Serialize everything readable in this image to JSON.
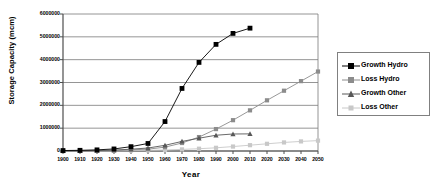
{
  "chart_data": {
    "type": "line",
    "title": "",
    "xlabel": "Year",
    "ylabel": "Storage Capacity (mcm)",
    "x": [
      1900,
      1910,
      1920,
      1930,
      1940,
      1950,
      1960,
      1970,
      1980,
      1990,
      2000,
      2010,
      2020,
      2030,
      2040,
      2050
    ],
    "xlim": [
      1900,
      2050
    ],
    "ylim": [
      0,
      6000000
    ],
    "ytick_labels": [
      "0",
      "1000000",
      "2000000",
      "3000000",
      "4000000",
      "5000000",
      "6000000"
    ],
    "ytick_values": [
      0,
      1000000,
      2000000,
      3000000,
      4000000,
      5000000,
      6000000
    ],
    "xtick_labels": [
      "1900",
      "1910",
      "1920",
      "1930",
      "1940",
      "1950",
      "1960",
      "1970",
      "1980",
      "1990",
      "2000",
      "2010",
      "2020",
      "2030",
      "2040",
      "2050"
    ],
    "grid": true,
    "legend_position": "right",
    "series": [
      {
        "name": "Growth Hydro",
        "marker": "square",
        "color": "#000000",
        "values": [
          20000,
          30000,
          50000,
          90000,
          190000,
          330000,
          1290000,
          2740000,
          3880000,
          4670000,
          5150000,
          5380000,
          null,
          null,
          null,
          null
        ]
      },
      {
        "name": "Loss Hydro",
        "marker": "square",
        "color": "#8c8c8c",
        "values": [
          0,
          5000,
          12000,
          25000,
          50000,
          80000,
          170000,
          350000,
          610000,
          960000,
          1350000,
          1780000,
          2220000,
          2640000,
          3060000,
          3480000
        ]
      },
      {
        "name": "Growth Other",
        "marker": "triangle",
        "color": "#585858",
        "values": [
          5000,
          10000,
          20000,
          40000,
          80000,
          130000,
          250000,
          420000,
          560000,
          690000,
          745000,
          750000,
          null,
          null,
          null,
          null
        ]
      },
      {
        "name": "Loss Other",
        "marker": "square",
        "color": "#c8c8c8",
        "values": [
          0,
          2000,
          5000,
          10000,
          18000,
          28000,
          45000,
          70000,
          100000,
          140000,
          195000,
          255000,
          315000,
          375000,
          420000,
          455000
        ]
      }
    ]
  },
  "legend": {
    "items": [
      {
        "label": "Growth Hydro"
      },
      {
        "label": "Loss Hydro"
      },
      {
        "label": "Growth Other"
      },
      {
        "label": "Loss Other"
      }
    ]
  },
  "colors": {
    "growth_hydro": "#000000",
    "loss_hydro": "#8c8c8c",
    "growth_other": "#585858",
    "loss_other": "#c8c8c8",
    "grid": "#7a7a7a",
    "axis": "#4d4d4d"
  }
}
